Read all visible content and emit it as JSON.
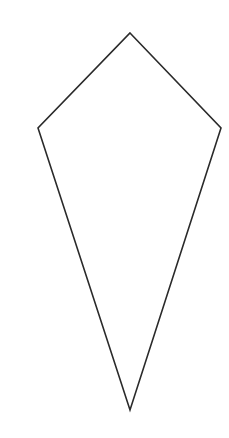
{
  "diagram": {
    "shape": "kite",
    "canvas": {
      "width": 229,
      "height": 438,
      "background": "#ffffff"
    },
    "stroke": {
      "color": "#2a2a2a",
      "width": 1.6
    },
    "fill": "none",
    "vertices": {
      "top": [
        130,
        33
      ],
      "right": [
        221,
        128
      ],
      "bottom": [
        130,
        410
      ],
      "left": [
        38,
        128
      ]
    }
  }
}
